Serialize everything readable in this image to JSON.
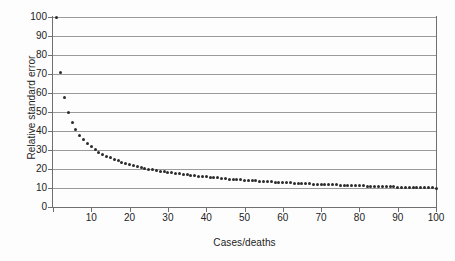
{
  "chart_data": {
    "type": "scatter",
    "title": "",
    "xlabel": "Cases/deaths",
    "ylabel": "Relative standard error",
    "xlim": [
      0,
      100
    ],
    "ylim": [
      0,
      100
    ],
    "xticks": [
      0,
      10,
      20,
      30,
      40,
      50,
      60,
      70,
      80,
      90,
      100
    ],
    "xtick_labels": [
      "",
      "10",
      "20",
      "30",
      "40",
      "50",
      "60",
      "70",
      "80",
      "90",
      "100"
    ],
    "yticks": [
      0,
      10,
      20,
      30,
      40,
      50,
      60,
      70,
      80,
      90,
      100
    ],
    "ytick_labels": [
      "0",
      "10",
      "20",
      "30",
      "40",
      "50",
      "60",
      "70",
      "80",
      "90",
      "100"
    ],
    "grid": "horizontal",
    "legend": "none",
    "marker_color": "#2b2b2b",
    "gridline_color": "#9a9a9a",
    "axis_color": "#6f6f6f",
    "background_color": "#fdfdfd",
    "relation": "y = 100 / sqrt(x)",
    "x": [
      1,
      2,
      3,
      4,
      5,
      6,
      7,
      8,
      9,
      10,
      11,
      12,
      13,
      14,
      15,
      16,
      17,
      18,
      19,
      20,
      21,
      22,
      23,
      24,
      25,
      26,
      27,
      28,
      29,
      30,
      31,
      32,
      33,
      34,
      35,
      36,
      37,
      38,
      39,
      40,
      41,
      42,
      43,
      44,
      45,
      46,
      47,
      48,
      49,
      50,
      51,
      52,
      53,
      54,
      55,
      56,
      57,
      58,
      59,
      60,
      61,
      62,
      63,
      64,
      65,
      66,
      67,
      68,
      69,
      70,
      71,
      72,
      73,
      74,
      75,
      76,
      77,
      78,
      79,
      80,
      81,
      82,
      83,
      84,
      85,
      86,
      87,
      88,
      89,
      90,
      91,
      92,
      93,
      94,
      95,
      96,
      97,
      98,
      99,
      100
    ],
    "y": [
      100.0,
      70.7,
      57.7,
      50.0,
      44.7,
      40.8,
      37.8,
      35.4,
      33.3,
      31.6,
      30.2,
      28.9,
      27.7,
      26.7,
      25.8,
      25.0,
      24.3,
      23.6,
      22.9,
      22.4,
      21.8,
      21.3,
      20.9,
      20.4,
      20.0,
      19.6,
      19.2,
      18.9,
      18.6,
      18.3,
      18.0,
      17.7,
      17.4,
      17.1,
      16.9,
      16.7,
      16.4,
      16.2,
      16.0,
      15.8,
      15.6,
      15.4,
      15.3,
      15.1,
      14.9,
      14.7,
      14.6,
      14.4,
      14.3,
      14.1,
      14.0,
      13.9,
      13.7,
      13.6,
      13.5,
      13.4,
      13.2,
      13.1,
      13.0,
      12.9,
      12.8,
      12.7,
      12.6,
      12.5,
      12.4,
      12.3,
      12.2,
      12.1,
      12.0,
      12.0,
      11.9,
      11.8,
      11.7,
      11.6,
      11.5,
      11.5,
      11.4,
      11.3,
      11.3,
      11.2,
      11.1,
      11.0,
      11.0,
      10.9,
      10.8,
      10.8,
      10.7,
      10.7,
      10.6,
      10.5,
      10.5,
      10.4,
      10.4,
      10.3,
      10.3,
      10.2,
      10.2,
      10.1,
      10.1,
      10.0
    ]
  }
}
